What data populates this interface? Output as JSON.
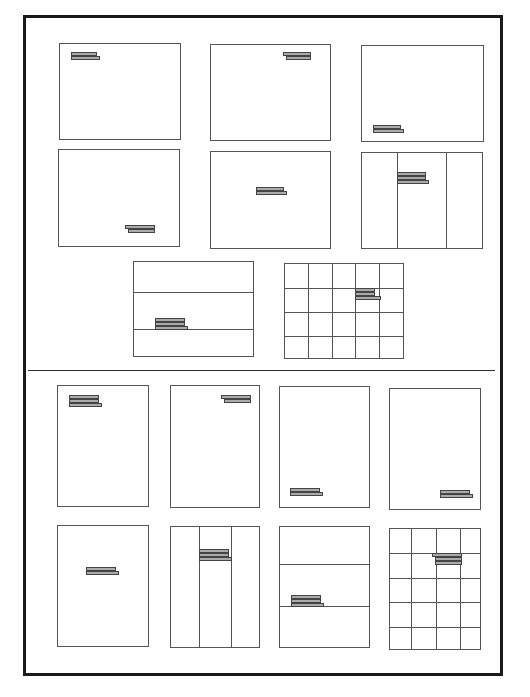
{
  "diagram": {
    "title": "",
    "sections": [
      {
        "name": "landscape",
        "pages": [
          {
            "id": "l-top-left",
            "x": 59,
            "y": 43,
            "w": 122,
            "h": 97,
            "grid": "none",
            "text": {
              "x": 11,
              "y": 8,
              "bars": [
                {
                  "dx": 0,
                  "w": 24
                },
                {
                  "dx": 0,
                  "w": 27
                }
              ]
            }
          },
          {
            "id": "l-top-right",
            "x": 210,
            "y": 44,
            "w": 121,
            "h": 97,
            "grid": "none",
            "text": {
              "x": 72,
              "y": 7,
              "bars": [
                {
                  "dx": 0,
                  "w": 26
                },
                {
                  "dx": 3,
                  "w": 23
                }
              ]
            }
          },
          {
            "id": "l-bottom-left",
            "x": 361,
            "y": 45,
            "w": 123,
            "h": 97,
            "grid": "none",
            "text": {
              "x": 11,
              "y": 79,
              "bars": [
                {
                  "dx": 0,
                  "w": 26
                },
                {
                  "dx": 0,
                  "w": 29
                }
              ]
            }
          },
          {
            "id": "l-bottom-right",
            "x": 58,
            "y": 149,
            "w": 122,
            "h": 98,
            "grid": "none",
            "text": {
              "x": 66,
              "y": 75,
              "bars": [
                {
                  "dx": 0,
                  "w": 28
                },
                {
                  "dx": 3,
                  "w": 25
                }
              ]
            }
          },
          {
            "id": "l-center",
            "x": 210,
            "y": 151,
            "w": 121,
            "h": 98,
            "grid": "none",
            "text": {
              "x": 45,
              "y": 35,
              "bars": [
                {
                  "dx": 0,
                  "w": 26
                },
                {
                  "dx": 0,
                  "w": 29
                }
              ]
            }
          },
          {
            "id": "l-columns",
            "x": 361,
            "y": 152,
            "w": 122,
            "h": 97,
            "grid": "cols",
            "cols": [
              35,
              84
            ],
            "text": {
              "x": 35,
              "y": 19,
              "bars": [
                {
                  "dx": 0,
                  "w": 27
                },
                {
                  "dx": 0,
                  "w": 27
                },
                {
                  "dx": 0,
                  "w": 30
                }
              ]
            }
          },
          {
            "id": "l-rows",
            "x": 133,
            "y": 261,
            "w": 121,
            "h": 96,
            "grid": "rows",
            "rows": [
              30,
              67
            ],
            "text": {
              "x": 21,
              "y": 56,
              "bars": [
                {
                  "dx": 0,
                  "w": 28
                },
                {
                  "dx": 0,
                  "w": 28
                },
                {
                  "dx": 0,
                  "w": 31
                }
              ]
            }
          },
          {
            "id": "l-grid",
            "x": 284,
            "y": 263,
            "w": 120,
            "h": 96,
            "grid": "table",
            "cols": [
              23,
              47,
              70,
              94
            ],
            "rows": [
              24,
              48,
              72
            ],
            "text": {
              "x": 70,
              "y": 24,
              "bars": [
                {
                  "dx": 0,
                  "w": 18
                },
                {
                  "dx": 0,
                  "w": 18
                },
                {
                  "dx": 0,
                  "w": 24
                }
              ]
            }
          }
        ]
      },
      {
        "name": "portrait",
        "pages": [
          {
            "id": "p-top-left",
            "x": 57,
            "y": 385,
            "w": 92,
            "h": 122,
            "grid": "none",
            "text": {
              "x": 11,
              "y": 9,
              "bars": [
                {
                  "dx": 0,
                  "w": 28
                },
                {
                  "dx": 0,
                  "w": 28
                },
                {
                  "dx": 0,
                  "w": 31
                }
              ]
            }
          },
          {
            "id": "p-top-right",
            "x": 170,
            "y": 385,
            "w": 90,
            "h": 123,
            "grid": "none",
            "text": {
              "x": 50,
              "y": 9,
              "bars": [
                {
                  "dx": 0,
                  "w": 28
                },
                {
                  "dx": 3,
                  "w": 25
                }
              ]
            }
          },
          {
            "id": "p-bottom-left",
            "x": 279,
            "y": 386,
            "w": 91,
            "h": 122,
            "grid": "none",
            "text": {
              "x": 10,
              "y": 101,
              "bars": [
                {
                  "dx": 0,
                  "w": 28
                },
                {
                  "dx": 0,
                  "w": 31
                }
              ]
            }
          },
          {
            "id": "p-bottom-right",
            "x": 389,
            "y": 388,
            "w": 92,
            "h": 122,
            "grid": "none",
            "text": {
              "x": 50,
              "y": 101,
              "bars": [
                {
                  "dx": 0,
                  "w": 28
                },
                {
                  "dx": 0,
                  "w": 31
                }
              ]
            }
          },
          {
            "id": "p-center",
            "x": 57,
            "y": 525,
            "w": 92,
            "h": 122,
            "grid": "none",
            "text": {
              "x": 28,
              "y": 41,
              "bars": [
                {
                  "dx": 0,
                  "w": 28
                },
                {
                  "dx": 0,
                  "w": 31
                }
              ]
            }
          },
          {
            "id": "p-columns",
            "x": 170,
            "y": 526,
            "w": 90,
            "h": 122,
            "grid": "cols",
            "cols": [
              28,
              60
            ],
            "text": {
              "x": 28,
              "y": 22,
              "bars": [
                {
                  "dx": 0,
                  "w": 28
                },
                {
                  "dx": 0,
                  "w": 28
                },
                {
                  "dx": 0,
                  "w": 31
                }
              ]
            }
          },
          {
            "id": "p-rows",
            "x": 279,
            "y": 526,
            "w": 91,
            "h": 122,
            "grid": "rows",
            "rows": [
              37,
              79
            ],
            "text": {
              "x": 11,
              "y": 68,
              "bars": [
                {
                  "dx": 0,
                  "w": 28
                },
                {
                  "dx": 0,
                  "w": 28
                },
                {
                  "dx": 0,
                  "w": 31
                }
              ]
            }
          },
          {
            "id": "p-grid",
            "x": 389,
            "y": 528,
            "w": 92,
            "h": 122,
            "grid": "table",
            "cols": [
              21,
              46,
              70
            ],
            "rows": [
              24,
              49,
              73,
              98
            ],
            "text": {
              "x": 42,
              "y": 24,
              "bars": [
                {
                  "dx": 0,
                  "w": 28
                },
                {
                  "dx": 3,
                  "w": 25
                },
                {
                  "dx": 3,
                  "w": 25
                }
              ]
            }
          }
        ]
      }
    ]
  }
}
